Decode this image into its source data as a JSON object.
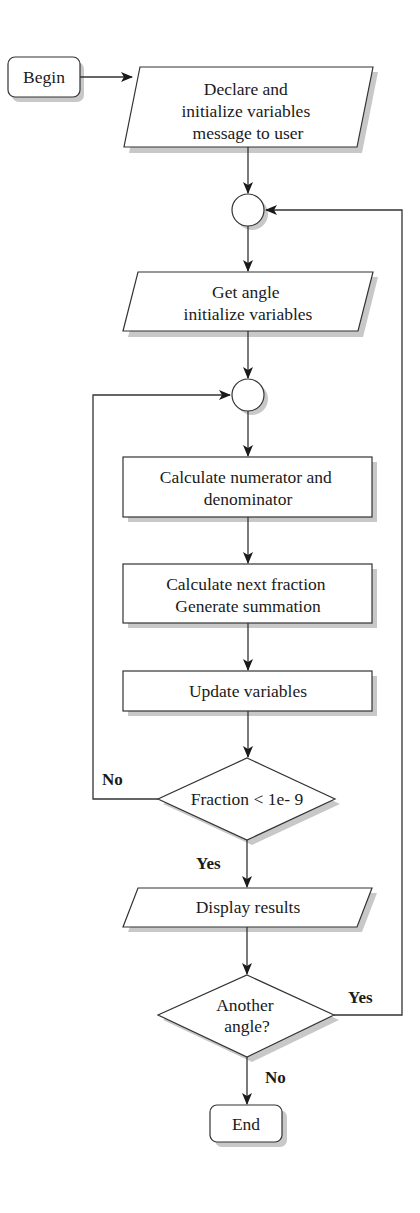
{
  "diagram": {
    "type": "flowchart",
    "nodes": {
      "begin": {
        "shape": "terminal",
        "label": "Begin"
      },
      "declare": {
        "shape": "io",
        "lines": [
          "Declare and",
          "initialize variables",
          "message to user"
        ]
      },
      "junction1": {
        "shape": "connector"
      },
      "get_angle": {
        "shape": "io",
        "lines": [
          "Get angle",
          "initialize variables"
        ]
      },
      "junction2": {
        "shape": "connector"
      },
      "calc_num_den": {
        "shape": "process",
        "lines": [
          "Calculate numerator and",
          "denominator"
        ]
      },
      "calc_fraction": {
        "shape": "process",
        "lines": [
          "Calculate next fraction",
          "Generate summation"
        ]
      },
      "update": {
        "shape": "process",
        "label": "Update variables"
      },
      "fraction_check": {
        "shape": "decision",
        "label": "Fraction < 1e- 9"
      },
      "display": {
        "shape": "io",
        "label": "Display results"
      },
      "another_angle": {
        "shape": "decision",
        "lines": [
          "Another",
          "angle?"
        ]
      },
      "end": {
        "shape": "terminal",
        "label": "End"
      }
    },
    "edge_labels": {
      "fraction_no": "No",
      "fraction_yes": "Yes",
      "another_yes": "Yes",
      "another_no": "No"
    },
    "edges": [
      {
        "from": "begin",
        "to": "declare"
      },
      {
        "from": "declare",
        "to": "junction1"
      },
      {
        "from": "junction1",
        "to": "get_angle"
      },
      {
        "from": "get_angle",
        "to": "junction2"
      },
      {
        "from": "junction2",
        "to": "calc_num_den"
      },
      {
        "from": "calc_num_den",
        "to": "calc_fraction"
      },
      {
        "from": "calc_fraction",
        "to": "update"
      },
      {
        "from": "update",
        "to": "fraction_check"
      },
      {
        "from": "fraction_check",
        "to": "junction2",
        "label": "No"
      },
      {
        "from": "fraction_check",
        "to": "display",
        "label": "Yes"
      },
      {
        "from": "display",
        "to": "another_angle"
      },
      {
        "from": "another_angle",
        "to": "junction1",
        "label": "Yes"
      },
      {
        "from": "another_angle",
        "to": "end",
        "label": "No"
      }
    ]
  }
}
